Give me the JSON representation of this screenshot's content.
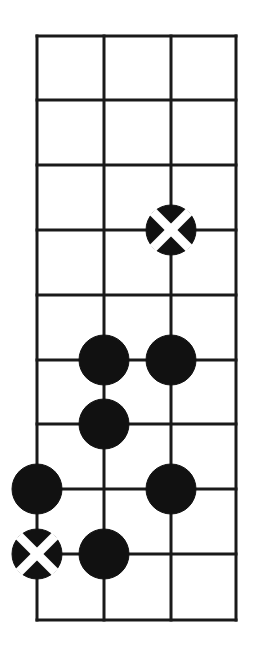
{
  "figure": {
    "kind": "go-board-diagram",
    "width": 260,
    "height": 656,
    "background_color": "#ffffff"
  },
  "board": {
    "line_color": "#1a1a1a",
    "line_width": 3,
    "border_width": 3,
    "columns": 4,
    "rows": 10,
    "column_x": [
      37,
      104,
      171,
      236
    ],
    "row_y": [
      36,
      100,
      165,
      230,
      295,
      360,
      424,
      489,
      554,
      620
    ],
    "origin_x": 37,
    "origin_y": 36,
    "cell_width": 66.3,
    "cell_height": 64.9,
    "edge_right_x": 236,
    "edge_bottom_y": 620
  },
  "stones": {
    "radius": 25,
    "black_color": "#111111",
    "mark_color": "#ffffff",
    "mark_width": 9,
    "items": [
      {
        "id": "stone-1",
        "color": "black",
        "col": 3,
        "row": 4,
        "x": 171,
        "y": 230,
        "mark": "cross"
      },
      {
        "id": "stone-2",
        "color": "black",
        "col": 2,
        "row": 6,
        "x": 104,
        "y": 360,
        "mark": "none"
      },
      {
        "id": "stone-3",
        "color": "black",
        "col": 3,
        "row": 6,
        "x": 171,
        "y": 360,
        "mark": "none"
      },
      {
        "id": "stone-4",
        "color": "black",
        "col": 2,
        "row": 7,
        "x": 104,
        "y": 424,
        "mark": "none"
      },
      {
        "id": "stone-5",
        "color": "black",
        "col": 1,
        "row": 8,
        "x": 37,
        "y": 489,
        "mark": "none"
      },
      {
        "id": "stone-6",
        "color": "black",
        "col": 3,
        "row": 8,
        "x": 171,
        "y": 489,
        "mark": "none"
      },
      {
        "id": "stone-7",
        "color": "black",
        "col": 1,
        "row": 9,
        "x": 37,
        "y": 554,
        "mark": "cross"
      },
      {
        "id": "stone-8",
        "color": "black",
        "col": 2,
        "row": 9,
        "x": 104,
        "y": 554,
        "mark": "none"
      }
    ]
  }
}
